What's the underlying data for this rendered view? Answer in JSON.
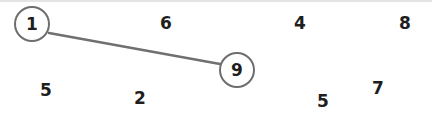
{
  "game": {
    "type": "connect-numbers",
    "line_color": "#707070",
    "circle_color": "#6e6e6e",
    "nodes": [
      {
        "label": "1",
        "x": 32,
        "y": 24,
        "selected": true
      },
      {
        "label": "6",
        "x": 166,
        "y": 23,
        "selected": false
      },
      {
        "label": "4",
        "x": 300,
        "y": 23,
        "selected": false
      },
      {
        "label": "8",
        "x": 405,
        "y": 23,
        "selected": false
      },
      {
        "label": "9",
        "x": 237,
        "y": 70,
        "selected": true
      },
      {
        "label": "5",
        "x": 46,
        "y": 90,
        "selected": false
      },
      {
        "label": "2",
        "x": 140,
        "y": 98,
        "selected": false
      },
      {
        "label": "7",
        "x": 378,
        "y": 88,
        "selected": false
      },
      {
        "label": "5",
        "x": 323,
        "y": 101,
        "selected": false
      }
    ],
    "connections": [
      {
        "from": 0,
        "to": 4
      }
    ]
  }
}
